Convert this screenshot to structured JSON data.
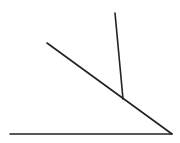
{
  "diagram": {
    "stroke_color": "#222222",
    "background": "#ffffff",
    "lines": [
      {
        "id": "baseline",
        "x1": 10,
        "y1": 134,
        "x2": 172,
        "y2": 134,
        "width": 1.6
      },
      {
        "id": "diagonal",
        "x1": 47,
        "y1": 43,
        "x2": 172,
        "y2": 134,
        "width": 1.6
      },
      {
        "id": "vertical",
        "x1": 115,
        "y1": 13,
        "x2": 123,
        "y2": 99,
        "width": 1.6
      }
    ]
  }
}
